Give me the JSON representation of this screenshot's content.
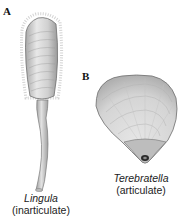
{
  "figure": {
    "panels": [
      {
        "id": "A",
        "label": "A",
        "genus": "Lingula",
        "group": "(inarticulate)"
      },
      {
        "id": "B",
        "label": "B",
        "genus": "Terebratella",
        "group": "(articulate)"
      }
    ]
  },
  "colors": {
    "shell_fill": "#d9d9d9",
    "shell_shadow": "#a8a8a8",
    "outline": "#6f6f6f",
    "background": "#ffffff",
    "text": "#222222"
  }
}
